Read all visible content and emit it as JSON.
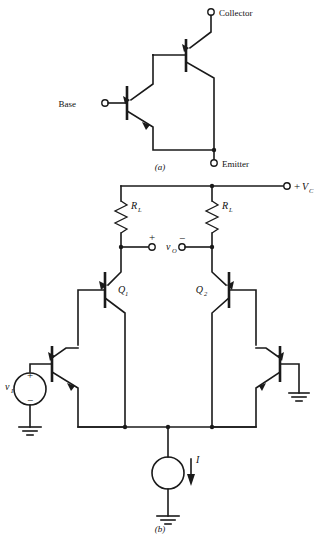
{
  "figure": {
    "background": "#ffffff",
    "ink": "#1a1a1a",
    "panels": [
      {
        "id": "a",
        "caption": "(a)",
        "title": "Darlington pair",
        "terminals": [
          {
            "name": "collector",
            "label": "Collector"
          },
          {
            "name": "base",
            "label": "Base"
          },
          {
            "name": "emitter",
            "label": "Emitter"
          }
        ],
        "devices": [
          {
            "name": "transistor-upper",
            "type": "npn"
          },
          {
            "name": "transistor-lower",
            "type": "npn"
          }
        ]
      },
      {
        "id": "b",
        "caption": "(b)",
        "title": "Differential amplifier stage",
        "labels": {
          "supply_sign": "+",
          "supply": "V",
          "supply_sub": "C",
          "resistor_left": "R",
          "resistor_left_sub": "L",
          "resistor_right": "R",
          "resistor_right_sub": "L",
          "output": "v",
          "output_sub": "O",
          "output_plus": "+",
          "output_minus": "−",
          "q1": "Q",
          "q1_sub": "1",
          "q2": "Q",
          "q2_sub": "2",
          "source": "v",
          "source_sub": "I",
          "source_plus": "+",
          "source_minus": "−",
          "current": "I"
        },
        "devices": [
          {
            "name": "transistor-q1",
            "type": "npn"
          },
          {
            "name": "transistor-q2",
            "type": "npn"
          },
          {
            "name": "transistor-left-input",
            "type": "npn"
          },
          {
            "name": "transistor-right-input",
            "type": "npn"
          },
          {
            "name": "resistor-load-left",
            "type": "resistor"
          },
          {
            "name": "resistor-load-right",
            "type": "resistor"
          },
          {
            "name": "voltage-source-input",
            "type": "voltage-source"
          },
          {
            "name": "current-source-tail",
            "type": "current-source"
          },
          {
            "name": "ground-left",
            "type": "ground"
          },
          {
            "name": "ground-right",
            "type": "ground"
          },
          {
            "name": "ground-tail",
            "type": "ground"
          }
        ]
      }
    ]
  }
}
